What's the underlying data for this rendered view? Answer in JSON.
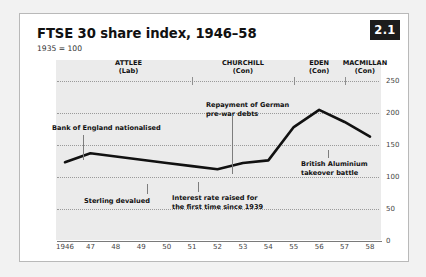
{
  "figure": {
    "badge": "2.1",
    "title": "FTSE 30 share index, 1946–58",
    "subtitle": "1935 = 100"
  },
  "chart_data": {
    "type": "line",
    "title": "FTSE 30 share index, 1946–58",
    "subtitle": "1935 = 100",
    "xlabel": "",
    "ylabel": "",
    "ylim": [
      0,
      250
    ],
    "yticks": [
      0,
      50,
      100,
      150,
      200,
      250
    ],
    "grid": true,
    "legend": "none",
    "categories": [
      "1946",
      "47",
      "48",
      "49",
      "50",
      "51",
      "52",
      "53",
      "54",
      "55",
      "56",
      "57",
      "58"
    ],
    "x": [
      1946,
      1947,
      1948,
      1949,
      1950,
      1951,
      1952,
      1953,
      1954,
      1955,
      1956,
      1957,
      1958
    ],
    "values": [
      123,
      137,
      132,
      127,
      122,
      117,
      112,
      122,
      126,
      178,
      205,
      186,
      163
    ],
    "series": [
      {
        "name": "FTSE 30 share index",
        "values": [
          123,
          137,
          132,
          127,
          122,
          117,
          112,
          122,
          126,
          178,
          205,
          186,
          163
        ]
      }
    ],
    "periods": [
      {
        "name": "ATTLEE",
        "party": "(Lab)",
        "start": 1946,
        "end": 1951
      },
      {
        "name": "CHURCHILL",
        "party": "(Con)",
        "start": 1951,
        "end": 1955
      },
      {
        "name": "EDEN",
        "party": "(Con)",
        "start": 1955,
        "end": 1957
      },
      {
        "name": "MACMILLAN",
        "party": "(Con)",
        "start": 1957,
        "end": 1958.6
      }
    ],
    "annotations": [
      {
        "id": "bank-of-england",
        "line1": "Bank of England nationalised",
        "line2": "",
        "x": 1947,
        "y": 130
      },
      {
        "id": "sterling-devalued",
        "line1": "Sterling devalued",
        "line2": "",
        "x": 1949.6,
        "y": 122
      },
      {
        "id": "interest-rate",
        "line1": "Interest rate raised for",
        "line2": "the first time since 1939",
        "x": 1952.3,
        "y": 113
      },
      {
        "id": "german-debts",
        "line1": "Repayment of German",
        "line2": "pre-war debts",
        "x": 1953.6,
        "y": 123
      },
      {
        "id": "british-aluminium",
        "line1": "British Aluminium",
        "line2": "takeover battle",
        "x": 1957.2,
        "y": 185
      }
    ]
  }
}
